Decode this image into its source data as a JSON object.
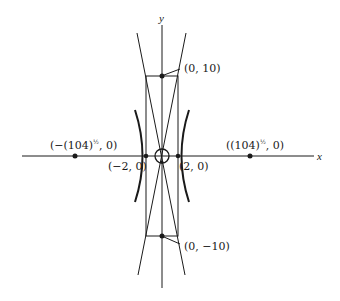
{
  "diagram": {
    "type": "hyperbola-with-asymptotes",
    "axes": {
      "x_label": "x",
      "y_label": "y"
    },
    "points": [
      {
        "id": "top",
        "label": "(0, 10)"
      },
      {
        "id": "bottom",
        "label": "(0, −10)"
      },
      {
        "id": "left-vertex",
        "label": "(−2, 0)"
      },
      {
        "id": "right-vertex",
        "label": "(2, 0)"
      },
      {
        "id": "left-focus",
        "label_main": "(−(104)",
        "label_sup": "½",
        "label_tail": " 0)"
      },
      {
        "id": "right-focus",
        "label_main": "((104)",
        "label_sup": "½",
        "label_tail": " 0)"
      }
    ],
    "colors": {
      "ink": "#1a1a1a",
      "background": "#ffffff"
    }
  }
}
